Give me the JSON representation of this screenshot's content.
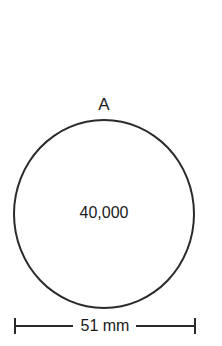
{
  "diagram": {
    "point_label": "A",
    "center_value": "40,000",
    "dimension_label": "51 mm",
    "colors": {
      "stroke": "#2a2a2a",
      "text": "#1a1a1a",
      "background": "#ffffff"
    }
  }
}
